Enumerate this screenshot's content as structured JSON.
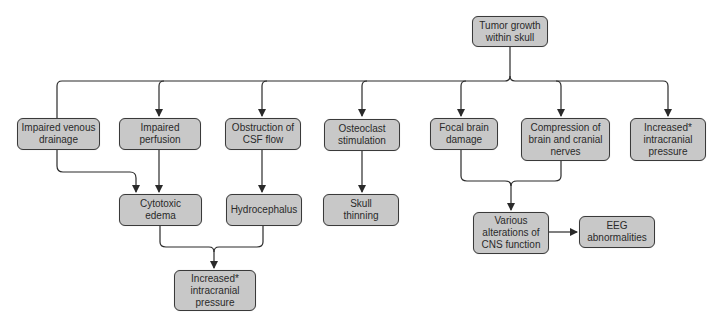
{
  "diagram": {
    "nodes": {
      "tumor": "Tumor growth\nwithin skull",
      "venous": "Impaired venous\ndrainage",
      "perfusion": "Impaired\nperfusion",
      "csf": "Obstruction of\nCSF flow",
      "osteoclast": "Osteoclast\nstimulation",
      "focal": "Focal brain\ndamage",
      "compression": "Compression of\nbrain and cranial\nnerves",
      "icp_right": "Increased*\nintracranial\npressure",
      "cytotoxic": "Cytotoxic\nedema",
      "hydrocephalus": "Hydrocephalus",
      "skull": "Skull\nthinning",
      "icp_bottom": "Increased*\nintracranial\npressure",
      "cns": "Various\nalterations of\nCNS function",
      "eeg": "EEG\nabnormalities"
    },
    "edges": [
      [
        "Tumor growth within skull",
        "Impaired venous drainage"
      ],
      [
        "Tumor growth within skull",
        "Impaired perfusion"
      ],
      [
        "Tumor growth within skull",
        "Obstruction of CSF flow"
      ],
      [
        "Tumor growth within skull",
        "Osteoclast stimulation"
      ],
      [
        "Tumor growth within skull",
        "Focal brain damage"
      ],
      [
        "Tumor growth within skull",
        "Compression of brain and cranial nerves"
      ],
      [
        "Tumor growth within skull",
        "Increased* intracranial pressure"
      ],
      [
        "Impaired venous drainage",
        "Cytotoxic edema"
      ],
      [
        "Impaired perfusion",
        "Cytotoxic edema"
      ],
      [
        "Obstruction of CSF flow",
        "Hydrocephalus"
      ],
      [
        "Osteoclast stimulation",
        "Skull thinning"
      ],
      [
        "Cytotoxic edema",
        "Increased* intracranial pressure"
      ],
      [
        "Hydrocephalus",
        "Increased* intracranial pressure"
      ],
      [
        "Focal brain damage",
        "Various alterations of CNS function"
      ],
      [
        "Compression of brain and cranial nerves",
        "Various alterations of CNS function"
      ],
      [
        "Various alterations of CNS function",
        "EEG abnormalities"
      ]
    ],
    "colors": {
      "node_fill": "#c8c8c8",
      "node_border": "#3a3a3a",
      "line": "#2a2a2a"
    }
  }
}
